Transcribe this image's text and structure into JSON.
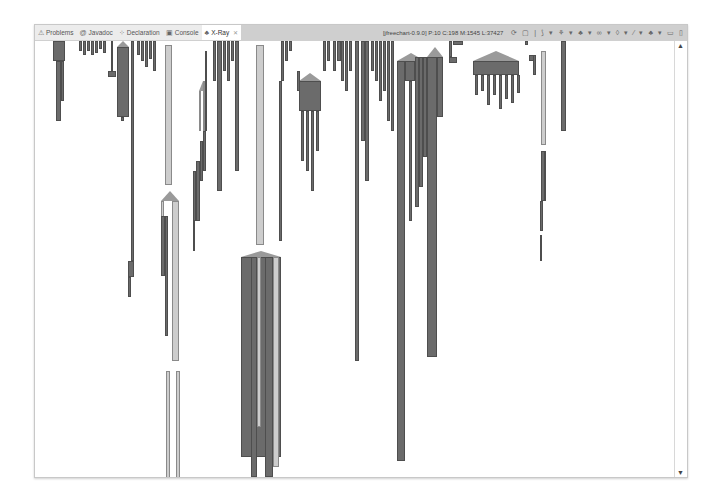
{
  "tabs": [
    {
      "label": "Problems",
      "icon": "problems-icon",
      "glyph": "⚠",
      "active": false
    },
    {
      "label": "Javadoc",
      "icon": "javadoc-icon",
      "glyph": "@",
      "active": false
    },
    {
      "label": "Declaration",
      "icon": "declaration-icon",
      "glyph": "⁘",
      "active": false
    },
    {
      "label": "Console",
      "icon": "console-icon",
      "glyph": "▣",
      "active": false
    },
    {
      "label": "X-Ray",
      "icon": "xray-icon",
      "glyph": "♣",
      "active": true,
      "close": "✕"
    }
  ],
  "status": "[jfreechart-0.9.0] P:10 C:198 M:1545 L:37427",
  "toolbar": [
    {
      "name": "refresh-icon",
      "glyph": "⟳"
    },
    {
      "name": "save-icon",
      "glyph": "▢"
    },
    {
      "name": "separator",
      "glyph": "|"
    },
    {
      "name": "layout-icon",
      "glyph": "⟆"
    },
    {
      "name": "dropdown-icon",
      "glyph": "▾"
    },
    {
      "name": "package-icon",
      "glyph": "⚘"
    },
    {
      "name": "dropdown-icon",
      "glyph": "▾"
    },
    {
      "name": "class-icon",
      "glyph": "♣"
    },
    {
      "name": "dropdown-icon",
      "glyph": "▾"
    },
    {
      "name": "link-icon",
      "glyph": "∞"
    },
    {
      "name": "dropdown-icon",
      "glyph": "▾"
    },
    {
      "name": "method-icon",
      "glyph": "◊"
    },
    {
      "name": "dropdown-icon",
      "glyph": "▾"
    },
    {
      "name": "filter-icon",
      "glyph": "⁄"
    },
    {
      "name": "dropdown-icon",
      "glyph": "▾"
    },
    {
      "name": "hierarchy-icon",
      "glyph": "♣"
    },
    {
      "name": "dropdown-icon",
      "glyph": "▾"
    },
    {
      "name": "minimize-icon",
      "glyph": "▭"
    },
    {
      "name": "maximize-icon",
      "glyph": "▯"
    }
  ],
  "scrollbar": {
    "up": "▲",
    "down": "▼"
  },
  "colors": {
    "dark": "#6b6b6b",
    "light": "#cdcdcd",
    "roof": "#9a9a9a"
  },
  "bars": [
    {
      "x": 18,
      "y": 0,
      "w": 12,
      "h": 20,
      "t": "dark"
    },
    {
      "x": 21,
      "y": 20,
      "w": 5,
      "h": 60,
      "t": "dark"
    },
    {
      "x": 26,
      "y": 20,
      "w": 3,
      "h": 40,
      "t": "dark"
    },
    {
      "x": 44,
      "y": 0,
      "w": 3,
      "h": 10,
      "t": "dark"
    },
    {
      "x": 48,
      "y": 0,
      "w": 3,
      "h": 14,
      "t": "dark"
    },
    {
      "x": 52,
      "y": 0,
      "w": 3,
      "h": 10,
      "t": "dark"
    },
    {
      "x": 56,
      "y": 0,
      "w": 3,
      "h": 14,
      "t": "dark"
    },
    {
      "x": 60,
      "y": 0,
      "w": 3,
      "h": 12,
      "t": "dark"
    },
    {
      "x": 64,
      "y": 0,
      "w": 3,
      "h": 8,
      "t": "dark"
    },
    {
      "x": 68,
      "y": 0,
      "w": 3,
      "h": 12,
      "t": "dark"
    },
    {
      "x": 76,
      "y": 0,
      "w": 2,
      "h": 30,
      "t": "dark"
    },
    {
      "x": 73,
      "y": 30,
      "w": 8,
      "h": 6,
      "t": "dark"
    },
    {
      "x": 82,
      "y": 6,
      "w": 12,
      "h": 70,
      "t": "dark"
    },
    {
      "x": 86,
      "y": 76,
      "w": 3,
      "h": 4,
      "t": "dark"
    },
    {
      "x": 96,
      "y": 0,
      "w": 3,
      "h": 220,
      "t": "dark"
    },
    {
      "x": 93,
      "y": 220,
      "w": 6,
      "h": 16,
      "t": "dark"
    },
    {
      "x": 93,
      "y": 236,
      "w": 3,
      "h": 20,
      "t": "dark"
    },
    {
      "x": 102,
      "y": 0,
      "w": 3,
      "h": 14,
      "t": "dark"
    },
    {
      "x": 106,
      "y": 0,
      "w": 3,
      "h": 20,
      "t": "dark"
    },
    {
      "x": 110,
      "y": 0,
      "w": 3,
      "h": 26,
      "t": "dark"
    },
    {
      "x": 114,
      "y": 0,
      "w": 3,
      "h": 18,
      "t": "dark"
    },
    {
      "x": 118,
      "y": 0,
      "w": 3,
      "h": 30,
      "t": "dark"
    },
    {
      "x": 130,
      "y": 4,
      "w": 7,
      "h": 140,
      "t": "light"
    },
    {
      "x": 126,
      "y": 160,
      "w": 3,
      "h": 50,
      "t": "light"
    },
    {
      "x": 126,
      "y": 175,
      "w": 4,
      "h": 60,
      "t": "dark"
    },
    {
      "x": 130,
      "y": 175,
      "w": 3,
      "h": 120,
      "t": "dark"
    },
    {
      "x": 137,
      "y": 160,
      "w": 7,
      "h": 160,
      "t": "light"
    },
    {
      "x": 131,
      "y": 330,
      "w": 4,
      "h": 110,
      "t": "light"
    },
    {
      "x": 141,
      "y": 330,
      "w": 4,
      "h": 110,
      "t": "light"
    },
    {
      "x": 158,
      "y": 130,
      "w": 3,
      "h": 50,
      "t": "dark"
    },
    {
      "x": 161,
      "y": 120,
      "w": 4,
      "h": 60,
      "t": "dark"
    },
    {
      "x": 165,
      "y": 100,
      "w": 3,
      "h": 40,
      "t": "dark"
    },
    {
      "x": 168,
      "y": 90,
      "w": 3,
      "h": 40,
      "t": "dark"
    },
    {
      "x": 164,
      "y": 50,
      "w": 2,
      "h": 40,
      "t": "light"
    },
    {
      "x": 168,
      "y": 40,
      "w": 2,
      "h": 50,
      "t": "light"
    },
    {
      "x": 170,
      "y": 10,
      "w": 2,
      "h": 80,
      "t": "dark"
    },
    {
      "x": 158,
      "y": 180,
      "w": 2,
      "h": 30,
      "t": "dark"
    },
    {
      "x": 178,
      "y": 0,
      "w": 3,
      "h": 40,
      "t": "dark"
    },
    {
      "x": 182,
      "y": 0,
      "w": 5,
      "h": 150,
      "t": "dark"
    },
    {
      "x": 188,
      "y": 0,
      "w": 3,
      "h": 30,
      "t": "dark"
    },
    {
      "x": 192,
      "y": 0,
      "w": 3,
      "h": 40,
      "t": "dark"
    },
    {
      "x": 196,
      "y": 0,
      "w": 3,
      "h": 20,
      "t": "dark"
    },
    {
      "x": 200,
      "y": 0,
      "w": 4,
      "h": 130,
      "t": "dark"
    },
    {
      "x": 221,
      "y": 4,
      "w": 8,
      "h": 200,
      "t": "light"
    },
    {
      "x": 206,
      "y": 216,
      "w": 40,
      "h": 200,
      "t": "dark"
    },
    {
      "x": 216,
      "y": 216,
      "w": 6,
      "h": 220,
      "t": "dark"
    },
    {
      "x": 222,
      "y": 216,
      "w": 4,
      "h": 170,
      "t": "light"
    },
    {
      "x": 230,
      "y": 216,
      "w": 8,
      "h": 220,
      "t": "dark"
    },
    {
      "x": 238,
      "y": 216,
      "w": 6,
      "h": 210,
      "t": "light"
    },
    {
      "x": 246,
      "y": 0,
      "w": 3,
      "h": 40,
      "t": "dark"
    },
    {
      "x": 244,
      "y": 40,
      "w": 3,
      "h": 160,
      "t": "dark"
    },
    {
      "x": 250,
      "y": 0,
      "w": 3,
      "h": 20,
      "t": "dark"
    },
    {
      "x": 254,
      "y": 0,
      "w": 3,
      "h": 10,
      "t": "dark"
    },
    {
      "x": 262,
      "y": 30,
      "w": 3,
      "h": 20,
      "t": "dark"
    },
    {
      "x": 264,
      "y": 40,
      "w": 22,
      "h": 30,
      "t": "dark"
    },
    {
      "x": 266,
      "y": 70,
      "w": 3,
      "h": 50,
      "t": "dark"
    },
    {
      "x": 271,
      "y": 70,
      "w": 3,
      "h": 60,
      "t": "dark"
    },
    {
      "x": 276,
      "y": 70,
      "w": 3,
      "h": 80,
      "t": "dark"
    },
    {
      "x": 281,
      "y": 70,
      "w": 3,
      "h": 40,
      "t": "dark"
    },
    {
      "x": 288,
      "y": 0,
      "w": 3,
      "h": 30,
      "t": "dark"
    },
    {
      "x": 292,
      "y": 0,
      "w": 3,
      "h": 20,
      "t": "dark"
    },
    {
      "x": 298,
      "y": 0,
      "w": 3,
      "h": 30,
      "t": "dark"
    },
    {
      "x": 302,
      "y": 0,
      "w": 4,
      "h": 20,
      "t": "dark"
    },
    {
      "x": 306,
      "y": 0,
      "w": 3,
      "h": 40,
      "t": "dark"
    },
    {
      "x": 310,
      "y": 0,
      "w": 3,
      "h": 50,
      "t": "dark"
    },
    {
      "x": 314,
      "y": 0,
      "w": 3,
      "h": 30,
      "t": "dark"
    },
    {
      "x": 320,
      "y": 0,
      "w": 4,
      "h": 320,
      "t": "dark"
    },
    {
      "x": 326,
      "y": 0,
      "w": 4,
      "h": 100,
      "t": "dark"
    },
    {
      "x": 330,
      "y": 0,
      "w": 4,
      "h": 140,
      "t": "dark"
    },
    {
      "x": 336,
      "y": 0,
      "w": 3,
      "h": 30,
      "t": "dark"
    },
    {
      "x": 340,
      "y": 0,
      "w": 3,
      "h": 40,
      "t": "dark"
    },
    {
      "x": 344,
      "y": 0,
      "w": 3,
      "h": 60,
      "t": "dark"
    },
    {
      "x": 348,
      "y": 0,
      "w": 3,
      "h": 50,
      "t": "dark"
    },
    {
      "x": 352,
      "y": 0,
      "w": 3,
      "h": 80,
      "t": "dark"
    },
    {
      "x": 356,
      "y": 0,
      "w": 3,
      "h": 90,
      "t": "dark"
    },
    {
      "x": 362,
      "y": 20,
      "w": 8,
      "h": 400,
      "t": "dark"
    },
    {
      "x": 370,
      "y": 20,
      "w": 10,
      "h": 20,
      "t": "dark"
    },
    {
      "x": 374,
      "y": 40,
      "w": 3,
      "h": 140,
      "t": "dark"
    },
    {
      "x": 380,
      "y": 16,
      "w": 4,
      "h": 150,
      "t": "dark"
    },
    {
      "x": 384,
      "y": 16,
      "w": 4,
      "h": 130,
      "t": "dark"
    },
    {
      "x": 388,
      "y": 16,
      "w": 4,
      "h": 100,
      "t": "dark"
    },
    {
      "x": 392,
      "y": 16,
      "w": 10,
      "h": 300,
      "t": "dark"
    },
    {
      "x": 402,
      "y": 16,
      "w": 6,
      "h": 60,
      "t": "dark"
    },
    {
      "x": 414,
      "y": 0,
      "w": 3,
      "h": 16,
      "t": "dark"
    },
    {
      "x": 414,
      "y": 16,
      "w": 8,
      "h": 6,
      "t": "dark"
    },
    {
      "x": 418,
      "y": 0,
      "w": 10,
      "h": 4,
      "t": "dark"
    },
    {
      "x": 438,
      "y": 20,
      "w": 46,
      "h": 14,
      "t": "dark"
    },
    {
      "x": 440,
      "y": 34,
      "w": 3,
      "h": 20,
      "t": "dark"
    },
    {
      "x": 446,
      "y": 34,
      "w": 3,
      "h": 16,
      "t": "dark"
    },
    {
      "x": 452,
      "y": 34,
      "w": 3,
      "h": 30,
      "t": "dark"
    },
    {
      "x": 458,
      "y": 34,
      "w": 3,
      "h": 20,
      "t": "dark"
    },
    {
      "x": 464,
      "y": 34,
      "w": 3,
      "h": 34,
      "t": "dark"
    },
    {
      "x": 470,
      "y": 34,
      "w": 3,
      "h": 24,
      "t": "dark"
    },
    {
      "x": 476,
      "y": 34,
      "w": 3,
      "h": 28,
      "t": "dark"
    },
    {
      "x": 482,
      "y": 34,
      "w": 3,
      "h": 18,
      "t": "dark"
    },
    {
      "x": 490,
      "y": 0,
      "w": 3,
      "h": 4,
      "t": "dark"
    },
    {
      "x": 494,
      "y": 14,
      "w": 6,
      "h": 6,
      "t": "dark"
    },
    {
      "x": 498,
      "y": 14,
      "w": 3,
      "h": 20,
      "t": "dark"
    },
    {
      "x": 506,
      "y": 10,
      "w": 5,
      "h": 94,
      "t": "light"
    },
    {
      "x": 506,
      "y": 110,
      "w": 5,
      "h": 50,
      "t": "dark"
    },
    {
      "x": 509,
      "y": 110,
      "w": 2,
      "h": 50,
      "t": "dark"
    },
    {
      "x": 505,
      "y": 160,
      "w": 3,
      "h": 30,
      "t": "dark"
    },
    {
      "x": 505,
      "y": 194,
      "w": 2,
      "h": 26,
      "t": "dark"
    },
    {
      "x": 526,
      "y": 0,
      "w": 5,
      "h": 90,
      "t": "dark"
    }
  ],
  "roofs": [
    {
      "x": 18,
      "y": -6,
      "w": 12,
      "h": 6
    },
    {
      "x": 82,
      "y": 0,
      "w": 12,
      "h": 6
    },
    {
      "x": 206,
      "y": 210,
      "w": 40,
      "h": 6
    },
    {
      "x": 264,
      "y": 32,
      "w": 22,
      "h": 8
    },
    {
      "x": 362,
      "y": 12,
      "w": 28,
      "h": 8
    },
    {
      "x": 392,
      "y": 6,
      "w": 16,
      "h": 10
    },
    {
      "x": 438,
      "y": 10,
      "w": 46,
      "h": 10
    },
    {
      "x": 126,
      "y": 150,
      "w": 18,
      "h": 10
    },
    {
      "x": 164,
      "y": 40,
      "w": 8,
      "h": 10
    }
  ]
}
